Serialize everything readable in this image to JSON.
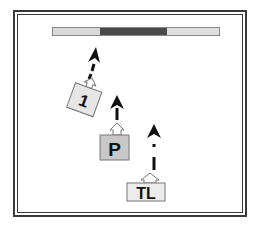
{
  "diagram": {
    "bar": {
      "segments": [
        {
          "name": "left-light",
          "color": "#d9d9d9",
          "width": 47
        },
        {
          "name": "middle-dark",
          "color": "#4a4a4a",
          "width": 67
        },
        {
          "name": "right-light",
          "color": "#dedede",
          "width": 54
        }
      ]
    },
    "tokens": [
      {
        "id": "token-1",
        "label": "1",
        "rotation": -25,
        "fill": "#e6e6e6",
        "arrow": "dashed-up"
      },
      {
        "id": "token-p",
        "label": "P",
        "rotation": 0,
        "fill": "#c8c8c8",
        "arrow": "dashed-up"
      },
      {
        "id": "token-tl",
        "label": "TL",
        "rotation": 0,
        "fill": "#ececec",
        "arrow": "dashed-up"
      }
    ],
    "colors": {
      "border": "#3a3a3a",
      "arrow": "#111111",
      "background": "#ffffff"
    }
  }
}
